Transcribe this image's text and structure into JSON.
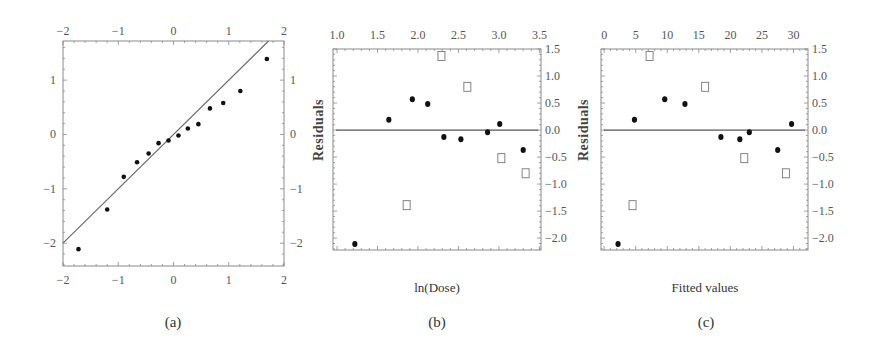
{
  "figure": {
    "captions": [
      "(a)",
      "(b)",
      "(c)"
    ],
    "colors": {
      "frame": "#8a8a8a",
      "line": "#6b6b6b",
      "dot": "#111111",
      "square": "#777777",
      "text": "#555555"
    }
  },
  "chart_data": [
    {
      "id": "a",
      "type": "scatter",
      "title": "",
      "caption": "(a)",
      "xlabel": "",
      "ylabel": "",
      "xlim": [
        -2,
        2
      ],
      "ylim": [
        -2.42,
        1.72
      ],
      "xticks": [
        -2,
        -1,
        0,
        1,
        2
      ],
      "yticks": [
        -2,
        -1,
        0,
        1
      ],
      "xtick_labels": [
        "−2",
        "−1",
        "0",
        "1",
        "2"
      ],
      "ytick_labels": [
        "−2",
        "−1",
        "0",
        "1"
      ],
      "ticks_on": [
        "top",
        "bottom",
        "left",
        "right"
      ],
      "grid": false,
      "reference_line": {
        "slope": 1,
        "intercept": 0
      },
      "series": [
        {
          "name": "normal quantile plot",
          "marker": "filled-circle",
          "x": [
            -1.72,
            -1.2,
            -0.9,
            -0.66,
            -0.45,
            -0.27,
            -0.09,
            0.09,
            0.26,
            0.45,
            0.66,
            0.9,
            1.21,
            1.69
          ],
          "y": [
            -2.11,
            -1.38,
            -0.78,
            -0.51,
            -0.35,
            -0.16,
            -0.11,
            -0.02,
            0.11,
            0.19,
            0.48,
            0.58,
            0.8,
            1.39
          ]
        }
      ]
    },
    {
      "id": "b",
      "type": "scatter",
      "title": "",
      "caption": "(b)",
      "xlabel": "ln(Dose)",
      "ylabel": "Residuals",
      "xlim": [
        0.95,
        3.52
      ],
      "ylim": [
        -2.22,
        1.5
      ],
      "xticks": [
        1.0,
        1.5,
        2.0,
        2.5,
        3.0,
        3.5
      ],
      "yticks": [
        1.5,
        1.0,
        0.5,
        0.0,
        -0.5,
        -1.0,
        -1.5,
        -2.0
      ],
      "xtick_labels": [
        "1.0",
        "1.5",
        "2.0",
        "2.5",
        "3.0",
        "3.5"
      ],
      "ytick_labels": [
        "1.5",
        "1.0",
        "0.5",
        "0.0",
        "−0.5",
        "−1.0",
        "−1.5",
        "−2.0"
      ],
      "xtick_position": "top",
      "ytick_position": "right",
      "grid": false,
      "reference_line": {
        "slope": 0,
        "intercept": 0
      },
      "series": [
        {
          "name": "filled points",
          "marker": "filled-circle",
          "x": [
            1.22,
            1.64,
            1.93,
            2.12,
            2.32,
            2.53,
            2.86,
            3.01,
            3.3
          ],
          "y": [
            -2.11,
            0.19,
            0.57,
            0.48,
            -0.13,
            -0.17,
            -0.04,
            0.11,
            -0.37
          ]
        },
        {
          "name": "open points",
          "marker": "open-square",
          "x": [
            1.86,
            2.29,
            2.61,
            3.03,
            3.33
          ],
          "y": [
            -1.39,
            1.37,
            0.8,
            -0.52,
            -0.8
          ]
        }
      ]
    },
    {
      "id": "c",
      "type": "scatter",
      "title": "",
      "caption": "(c)",
      "xlabel": "Fitted values",
      "ylabel": "Residuals",
      "xlim": [
        -0.5,
        32.3
      ],
      "ylim": [
        -2.22,
        1.5
      ],
      "xticks": [
        0,
        5,
        10,
        15,
        20,
        25,
        30
      ],
      "yticks": [
        1.5,
        1.0,
        0.5,
        0.0,
        -0.5,
        -1.0,
        -1.5,
        -2.0
      ],
      "xtick_labels": [
        "0",
        "5",
        "10",
        "15",
        "20",
        "25",
        "30"
      ],
      "ytick_labels": [
        "1.5",
        "1.0",
        "0.5",
        "0.0",
        "−0.5",
        "−1.0",
        "−1.5",
        "−2.0"
      ],
      "xtick_position": "top",
      "ytick_position": "right",
      "grid": false,
      "reference_line": {
        "slope": 0,
        "intercept": 0
      },
      "series": [
        {
          "name": "filled points",
          "marker": "filled-circle",
          "x": [
            2.2,
            4.8,
            9.6,
            12.8,
            18.5,
            21.5,
            23.0,
            27.5,
            29.7
          ],
          "y": [
            -2.11,
            0.19,
            0.57,
            0.48,
            -0.13,
            -0.17,
            -0.04,
            -0.37,
            0.11
          ]
        },
        {
          "name": "open points",
          "marker": "open-square",
          "x": [
            4.5,
            7.2,
            16.0,
            22.2,
            28.8
          ],
          "y": [
            -1.39,
            1.37,
            0.8,
            -0.52,
            -0.8
          ]
        }
      ]
    }
  ]
}
